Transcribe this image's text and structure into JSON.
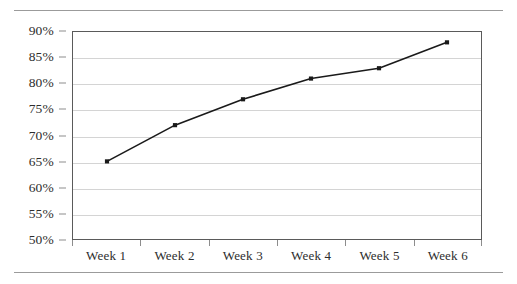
{
  "chart_data": {
    "type": "line",
    "title": "",
    "subtitle": "",
    "xlabel": "",
    "ylabel": "",
    "categories": [
      "Week 1",
      "Week 2",
      "Week 3",
      "Week 4",
      "Week 5",
      "Week 6"
    ],
    "values": [
      65,
      72,
      77,
      81,
      83,
      88
    ],
    "value_suffix": "%",
    "series": [
      {
        "name": "",
        "values": [
          65,
          72,
          77,
          81,
          83,
          88
        ]
      }
    ],
    "ylim": [
      50,
      90
    ],
    "ytick_step": 5,
    "ytick_labels": [
      "90%",
      "85%",
      "80%",
      "75%",
      "70%",
      "65%",
      "60%",
      "55%",
      "50%"
    ],
    "ytick_values": [
      90,
      85,
      80,
      75,
      70,
      65,
      60,
      55,
      50
    ],
    "grid": true,
    "grid_axis": "y",
    "legend": false,
    "legend_position": "none",
    "markers": true,
    "marker_shape": "square",
    "colors": {
      "line": "#1a1a1a",
      "marker": "#1a1a1a",
      "gridline": "#d4d4d4",
      "frame": "#5a5a5a",
      "axis_text": "#2d2d2d",
      "rule": "#9b9b9b",
      "background": "#ffffff"
    }
  }
}
